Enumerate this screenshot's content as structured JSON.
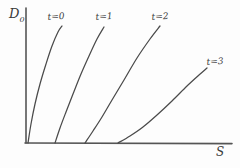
{
  "figure": {
    "name": "hand-drawn-curve-family-plot",
    "background_color": "#fdfdfd",
    "stroke_color": "#4a4a4a",
    "axis_color": "#555555"
  },
  "axes": {
    "y_label": "D",
    "y_label_sub": "0",
    "x_label": "S",
    "origin": [
      26,
      143
    ],
    "y_top": 8,
    "x_right": 232,
    "grid": false
  },
  "chart_data": {
    "type": "line",
    "title": "",
    "subtitle": "",
    "xlabel": "S",
    "ylabel": "D0",
    "xlim": [
      0,
      100
    ],
    "ylim": [
      0,
      100
    ],
    "grid": false,
    "legend_position": "inline-curve-end",
    "annotations": [
      "t=0",
      "t=1",
      "t=2",
      "t=3"
    ],
    "series": [
      {
        "name": "t=0",
        "label": "t=0",
        "points_px": [
          [
            28,
            143
          ],
          [
            31,
            124
          ],
          [
            35,
            104
          ],
          [
            40,
            84
          ],
          [
            46,
            64
          ],
          [
            52,
            46
          ],
          [
            58,
            32
          ],
          [
            62,
            26
          ]
        ],
        "x": [
          1,
          3,
          6,
          10,
          15,
          20,
          25,
          28
        ],
        "values": [
          0,
          15,
          30,
          46,
          62,
          76,
          87,
          92
        ]
      },
      {
        "name": "t=1",
        "label": "t=1",
        "points_px": [
          [
            55,
            143
          ],
          [
            60,
            128
          ],
          [
            66,
            112
          ],
          [
            73,
            94
          ],
          [
            81,
            74
          ],
          [
            89,
            56
          ],
          [
            97,
            39
          ],
          [
            104,
            27
          ]
        ],
        "x": [
          19,
          23,
          28,
          33,
          40,
          46,
          52,
          58
        ],
        "values": [
          0,
          11,
          23,
          36,
          51,
          65,
          78,
          87
        ]
      },
      {
        "name": "t=2",
        "label": "t=2",
        "points_px": [
          [
            85,
            143
          ],
          [
            93,
            131
          ],
          [
            102,
            117
          ],
          [
            112,
            100
          ],
          [
            124,
            80
          ],
          [
            137,
            58
          ],
          [
            150,
            39
          ],
          [
            160,
            26
          ]
        ],
        "x": [
          38,
          44,
          49,
          57,
          65,
          75,
          84,
          92
        ],
        "values": [
          0,
          9,
          19,
          32,
          47,
          63,
          78,
          88
        ]
      },
      {
        "name": "t=3",
        "label": "t=3",
        "points_px": [
          [
            118,
            143
          ],
          [
            130,
            136
          ],
          [
            143,
            127
          ],
          [
            157,
            115
          ],
          [
            172,
            101
          ],
          [
            187,
            86
          ],
          [
            199,
            75
          ],
          [
            207,
            68
          ]
        ],
        "x": [
          60,
          68,
          77,
          86,
          96,
          106,
          114,
          119
        ],
        "values": [
          0,
          5,
          12,
          21,
          31,
          42,
          50,
          56
        ]
      }
    ]
  }
}
